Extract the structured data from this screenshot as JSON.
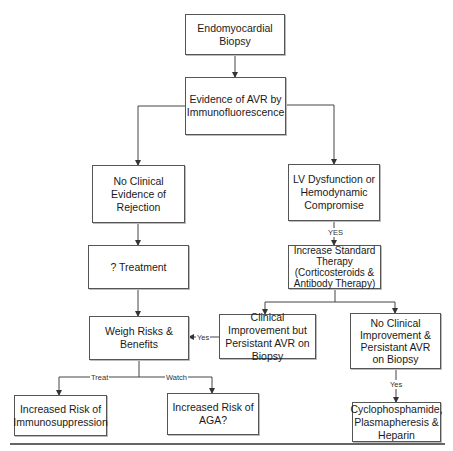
{
  "diagram": {
    "nodes": {
      "biopsy": "Endomyocardial Biopsy",
      "evidence": "Evidence of AVR by Immunofluorescence",
      "no_clinical_evidence": "No Clinical Evidence of Rejection",
      "lv_dysfunction": "LV Dysfunction or Hemodynamic Compromise",
      "treatment": "? Treatment",
      "increase_therapy": "Increase Standard Therapy (Corticosteroids & Antibody Therapy)",
      "weigh": "Weigh Risks & Benefits",
      "clinical_improvement": "Clinical Improvement but Persistant AVR on Biopsy",
      "no_clinical_improvement": "No Clinical Improvement & Persistant AVR on Biopsy",
      "immunosuppression": "Increased Risk of Immunosuppression",
      "aga": "Increased Risk of AGA?",
      "cyclophosphamide": "Cyclophosphamide, Plasmapheresis & Heparin"
    },
    "edge_labels": {
      "yes_lv": "YES",
      "yes_clinical": "Yes",
      "yes_no_improvement": "Yes",
      "treat": "Treat",
      "watch": "Watch"
    }
  }
}
